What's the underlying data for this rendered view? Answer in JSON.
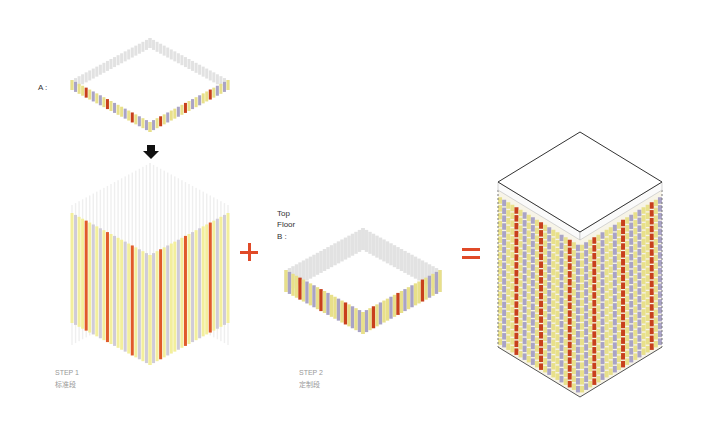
{
  "labels": {
    "a": "A :",
    "b_line1": "Top",
    "b_line2": "Floor",
    "b_line3": "B :"
  },
  "steps": [
    {
      "title": "STEP 1",
      "subtitle": "标准段"
    },
    {
      "title": "STEP 2",
      "subtitle": "定制段"
    }
  ],
  "operators": {
    "plus": "+",
    "equals": "="
  },
  "colors": {
    "yellow": "#e8e08a",
    "pale_yellow": "#f3ef9c",
    "lavender": "#a9a3c6",
    "red": "#c8401c",
    "orange_red": "#e05a2a",
    "grey": "#d6d6d6",
    "operator": "#e04a28",
    "arrow": "#111111"
  },
  "pattern": [
    "y",
    "l",
    "y",
    "y",
    "r",
    "y",
    "l",
    "y",
    "l",
    "y",
    "r",
    "y",
    "l",
    "y",
    "y",
    "l",
    "y",
    "r",
    "y",
    "l"
  ]
}
